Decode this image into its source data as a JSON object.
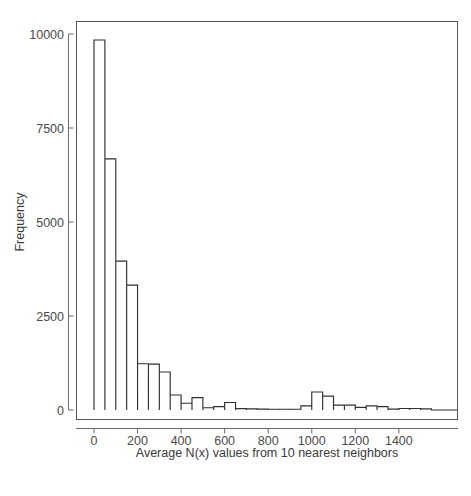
{
  "figure": {
    "name": "histogram-figure",
    "background_color": "#ffffff",
    "frame_color": "#55555a",
    "bar_stroke_color": "#303030",
    "bar_fill_color": "#ffffff",
    "text_color": "#3a3a3a"
  },
  "chart_data": {
    "type": "bar",
    "title": "",
    "subtitle": "",
    "xlabel": "Average N(x) values from 10 nearest neighbors",
    "ylabel": "Frequency",
    "xlim": [
      -40,
      1600
    ],
    "ylim": [
      0,
      10400
    ],
    "xticks": [
      0,
      200,
      400,
      600,
      800,
      1000,
      1200,
      1400
    ],
    "xticklabels": [
      "0",
      "200",
      "400",
      "600",
      "800",
      "1000",
      "1200",
      "1400"
    ],
    "yticks": [
      0,
      2500,
      5000,
      7500,
      10000
    ],
    "yticklabels": [
      "0",
      "2500",
      "5000",
      "7500",
      "10000"
    ],
    "grid": false,
    "legend": null,
    "bin_width": 50,
    "bin_edges": [
      0,
      50,
      100,
      150,
      200,
      250,
      300,
      350,
      400,
      450,
      500,
      550,
      600,
      650,
      700,
      750,
      800,
      850,
      900,
      950,
      1000,
      1050,
      1100,
      1150,
      1200,
      1250,
      1300,
      1350,
      1400,
      1450,
      1500,
      1550
    ],
    "categories": [
      "0-50",
      "50-100",
      "100-150",
      "150-200",
      "200-250",
      "250-300",
      "300-350",
      "350-400",
      "400-450",
      "450-500",
      "500-550",
      "550-600",
      "600-650",
      "650-700",
      "700-750",
      "750-800",
      "800-850",
      "850-900",
      "900-950",
      "950-1000",
      "1000-1050",
      "1050-1100",
      "1100-1150",
      "1150-1200",
      "1200-1250",
      "1250-1300",
      "1300-1350",
      "1350-1400",
      "1400-1450",
      "1450-1500",
      "1500-1550"
    ],
    "values": [
      9840,
      6680,
      3960,
      3320,
      1230,
      1220,
      1010,
      400,
      180,
      330,
      60,
      90,
      200,
      35,
      30,
      25,
      20,
      20,
      20,
      110,
      480,
      370,
      130,
      130,
      70,
      110,
      90,
      25,
      40,
      40,
      30
    ]
  },
  "annotations": {
    "peak_bin_label": "",
    "secondary_mode_label": ""
  }
}
